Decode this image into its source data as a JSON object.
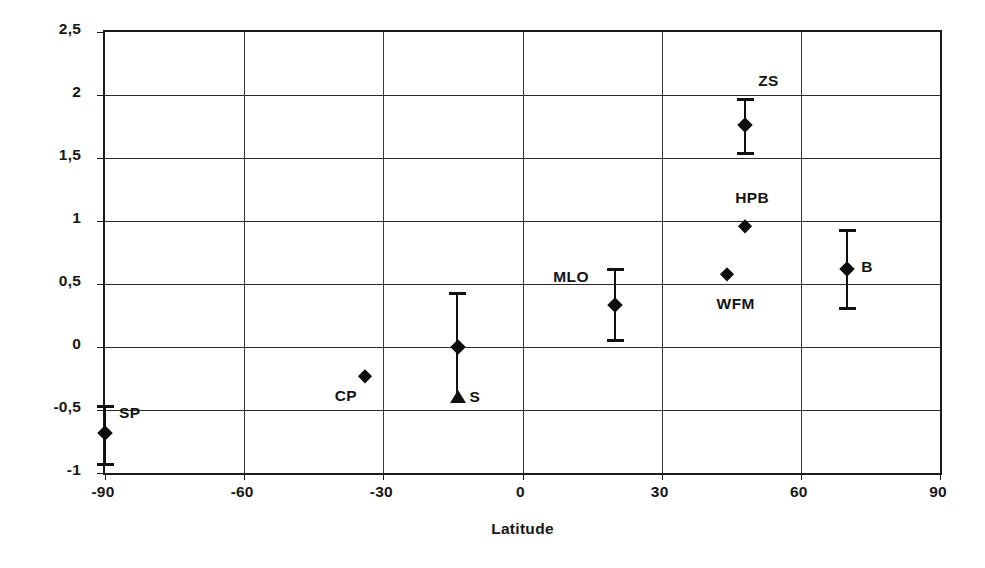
{
  "chart_data": {
    "type": "scatter",
    "title": "",
    "xlabel": "Latitude",
    "ylabel": "Trend [% / yr]",
    "xlim": [
      -90,
      90
    ],
    "ylim": [
      -1,
      2.5
    ],
    "xticks": [
      -90,
      -60,
      -30,
      0,
      30,
      60,
      90
    ],
    "xtick_labels": [
      "-90",
      "-60",
      "-30",
      "0",
      "30",
      "60",
      "90"
    ],
    "yticks": [
      -1,
      -0.5,
      0,
      0.5,
      1,
      1.5,
      2,
      2.5
    ],
    "ytick_labels": [
      "-1",
      "-0,5",
      "0",
      "0,5",
      "1",
      "1,5",
      "2",
      "2,5"
    ],
    "grid": "both",
    "legend": "none",
    "marker": "filled-diamond",
    "points": [
      {
        "label": "SP",
        "x": -90,
        "y": -0.68,
        "yerr_low": -0.92,
        "yerr_high": -0.46,
        "has_errorbar": true,
        "lower_cap_shape": "bar",
        "label_dx": 14,
        "label_dy": -20
      },
      {
        "label": "CP",
        "x": -34,
        "y": -0.23,
        "has_errorbar": false,
        "label_dx": -30,
        "label_dy": 20
      },
      {
        "label": "S",
        "x": -14,
        "y": 0.0,
        "yerr_low": -0.43,
        "yerr_high": 0.44,
        "has_errorbar": true,
        "lower_cap_shape": "triangle",
        "label_dx": 12,
        "label_dy": 50
      },
      {
        "label": "MLO",
        "x": 20,
        "y": 0.33,
        "yerr_low": 0.06,
        "yerr_high": 0.63,
        "has_errorbar": true,
        "lower_cap_shape": "bar",
        "label_dx": -62,
        "label_dy": -28
      },
      {
        "label": "WFM",
        "x": 44,
        "y": 0.58,
        "has_errorbar": false,
        "label_dx": -10,
        "label_dy": 30
      },
      {
        "label": "HPB",
        "x": 48,
        "y": 0.96,
        "has_errorbar": false,
        "label_dx": -10,
        "label_dy": -28
      },
      {
        "label": "ZS",
        "x": 48,
        "y": 1.76,
        "yerr_low": 1.55,
        "yerr_high": 1.98,
        "has_errorbar": true,
        "lower_cap_shape": "bar",
        "label_dx": 13,
        "label_dy": -44
      },
      {
        "label": "B",
        "x": 70,
        "y": 0.62,
        "yerr_low": 0.32,
        "yerr_high": 0.94,
        "has_errorbar": true,
        "lower_cap_shape": "bar",
        "label_dx": 14,
        "label_dy": -2
      }
    ]
  },
  "style": {
    "axis_color": "#1b1b1b",
    "grid_color": "#2a2a2a",
    "marker_color": "#0d0d0d",
    "background": "#ffffff"
  }
}
